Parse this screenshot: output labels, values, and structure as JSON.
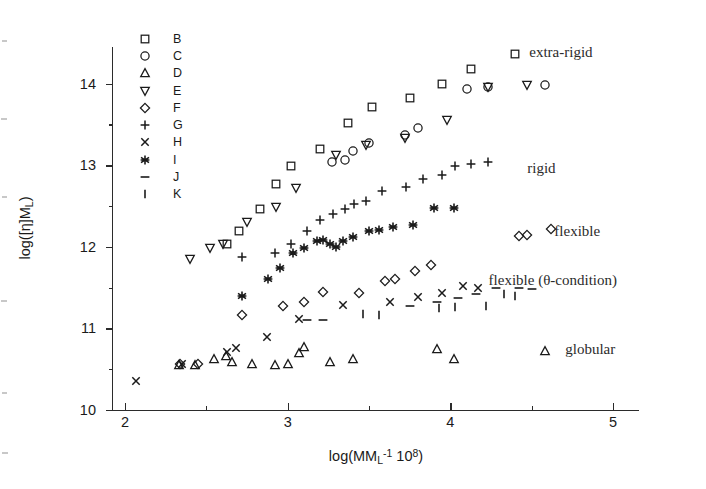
{
  "chart_data": {
    "type": "scatter",
    "title": "",
    "xlabel": "log(MM_L^-1 10^8)",
    "xlabel_parts": {
      "pre": "log(MM",
      "sub": "L",
      "sup": "-1",
      "mid": " 10",
      "sup2": "8",
      "post": ")"
    },
    "ylabel": "log([η]M_L)",
    "ylabel_parts": {
      "pre": "log([η]M",
      "sub": "L",
      "post": ")"
    },
    "xlim": [
      1.92,
      5.25
    ],
    "ylim": [
      10.0,
      14.45
    ],
    "xticks": [
      2,
      3,
      4,
      5
    ],
    "xticks_minor": [
      2.5,
      3.5,
      4.5
    ],
    "yticks": [
      10,
      11,
      12,
      13,
      14
    ],
    "yticks_minor": [
      10.5,
      11.5,
      12.5,
      13.5
    ],
    "grid": false,
    "legend_position": "upper-left-inside",
    "series": [
      {
        "name": "B",
        "marker": "square",
        "points": [
          [
            2.63,
            12.03
          ],
          [
            2.7,
            12.19
          ],
          [
            2.83,
            12.47
          ],
          [
            2.93,
            12.77
          ],
          [
            3.02,
            12.99
          ],
          [
            3.2,
            13.2
          ],
          [
            3.37,
            13.52
          ],
          [
            3.52,
            13.72
          ],
          [
            3.75,
            13.82
          ],
          [
            3.95,
            14.0
          ],
          [
            4.13,
            14.18
          ],
          [
            4.4,
            14.37
          ]
        ]
      },
      {
        "name": "C",
        "marker": "circle",
        "points": [
          [
            3.27,
            13.04
          ],
          [
            3.35,
            13.06
          ],
          [
            3.4,
            13.17
          ],
          [
            3.5,
            13.27
          ],
          [
            3.72,
            13.37
          ],
          [
            3.8,
            13.46
          ],
          [
            4.1,
            13.93
          ],
          [
            4.23,
            13.96
          ],
          [
            4.58,
            13.98
          ]
        ]
      },
      {
        "name": "D",
        "marker": "triangle-up",
        "points": [
          [
            2.33,
            10.55
          ],
          [
            2.43,
            10.55
          ],
          [
            2.55,
            10.63
          ],
          [
            2.62,
            10.66
          ],
          [
            2.66,
            10.59
          ],
          [
            2.78,
            10.57
          ],
          [
            2.92,
            10.55
          ],
          [
            3.0,
            10.56
          ],
          [
            3.07,
            10.7
          ],
          [
            3.1,
            10.77
          ],
          [
            3.26,
            10.59
          ],
          [
            3.4,
            10.62
          ],
          [
            3.92,
            10.75
          ],
          [
            4.02,
            10.63
          ],
          [
            4.58,
            10.72
          ]
        ]
      },
      {
        "name": "E",
        "marker": "triangle-down",
        "points": [
          [
            2.4,
            11.85
          ],
          [
            2.52,
            11.99
          ],
          [
            2.6,
            12.03
          ],
          [
            2.75,
            12.3
          ],
          [
            2.93,
            12.49
          ],
          [
            3.05,
            12.72
          ],
          [
            3.3,
            13.13
          ],
          [
            3.48,
            13.25
          ],
          [
            3.72,
            13.33
          ],
          [
            3.98,
            13.56
          ],
          [
            4.23,
            13.96
          ],
          [
            4.47,
            13.99
          ]
        ]
      },
      {
        "name": "F",
        "marker": "diamond",
        "points": [
          [
            2.34,
            10.56
          ],
          [
            2.45,
            10.57
          ],
          [
            2.72,
            11.16
          ],
          [
            2.97,
            11.28
          ],
          [
            3.1,
            11.33
          ],
          [
            3.22,
            11.45
          ],
          [
            3.44,
            11.44
          ],
          [
            3.6,
            11.58
          ],
          [
            3.66,
            11.6
          ],
          [
            3.78,
            11.7
          ],
          [
            3.88,
            11.78
          ],
          [
            4.42,
            12.13
          ],
          [
            4.47,
            12.14
          ],
          [
            4.62,
            12.22
          ]
        ]
      },
      {
        "name": "G",
        "marker": "plus",
        "points": [
          [
            2.72,
            11.87
          ],
          [
            2.92,
            11.92
          ],
          [
            3.02,
            12.03
          ],
          [
            3.12,
            12.2
          ],
          [
            3.2,
            12.33
          ],
          [
            3.28,
            12.4
          ],
          [
            3.35,
            12.47
          ],
          [
            3.41,
            12.52
          ],
          [
            3.48,
            12.56
          ],
          [
            3.58,
            12.68
          ],
          [
            3.73,
            12.73
          ],
          [
            3.83,
            12.83
          ],
          [
            3.95,
            12.88
          ],
          [
            4.03,
            12.99
          ],
          [
            4.13,
            13.02
          ],
          [
            4.23,
            13.04
          ]
        ]
      },
      {
        "name": "H",
        "marker": "cross",
        "points": [
          [
            2.07,
            10.36
          ],
          [
            2.35,
            10.57
          ],
          [
            2.63,
            10.71
          ],
          [
            2.68,
            10.76
          ],
          [
            2.87,
            10.9
          ],
          [
            3.07,
            11.12
          ],
          [
            3.34,
            11.29
          ],
          [
            3.63,
            11.33
          ],
          [
            3.8,
            11.38
          ],
          [
            3.95,
            11.43
          ],
          [
            4.08,
            11.52
          ],
          [
            4.17,
            11.5
          ]
        ]
      },
      {
        "name": "I",
        "marker": "asterisk",
        "points": [
          [
            2.72,
            11.4
          ],
          [
            2.88,
            11.61
          ],
          [
            2.95,
            11.74
          ],
          [
            3.03,
            11.92
          ],
          [
            3.1,
            11.98
          ],
          [
            3.18,
            12.07
          ],
          [
            3.22,
            12.09
          ],
          [
            3.26,
            12.03
          ],
          [
            3.3,
            12.0
          ],
          [
            3.34,
            12.07
          ],
          [
            3.4,
            12.12
          ],
          [
            3.5,
            12.2
          ],
          [
            3.56,
            12.21
          ],
          [
            3.65,
            12.24
          ],
          [
            3.77,
            12.27
          ],
          [
            3.9,
            12.48
          ],
          [
            4.02,
            12.48
          ]
        ]
      },
      {
        "name": "J",
        "marker": "dash",
        "points": [
          [
            3.12,
            11.1
          ],
          [
            3.22,
            11.1
          ],
          [
            3.75,
            11.28
          ],
          [
            3.92,
            11.32
          ],
          [
            4.05,
            11.37
          ],
          [
            4.16,
            11.42
          ],
          [
            4.28,
            11.49
          ],
          [
            4.42,
            11.5
          ],
          [
            4.5,
            11.48
          ]
        ]
      },
      {
        "name": "K",
        "marker": "bar",
        "points": [
          [
            3.46,
            11.18
          ],
          [
            3.56,
            11.17
          ],
          [
            3.93,
            11.25
          ],
          [
            4.03,
            11.26
          ],
          [
            4.22,
            11.28
          ],
          [
            4.33,
            11.42
          ],
          [
            4.4,
            11.4
          ]
        ]
      }
    ],
    "annotations": [
      {
        "text": "extra-rigid",
        "x": 4.68,
        "y": 14.38
      },
      {
        "text": "rigid",
        "x": 4.56,
        "y": 12.95
      },
      {
        "text": "flexible",
        "x": 4.78,
        "y": 12.18
      },
      {
        "text": "flexible (θ-condition)",
        "x": 4.63,
        "y": 11.58
      },
      {
        "text": "globular",
        "x": 4.86,
        "y": 10.73
      }
    ]
  },
  "legend": {
    "items": [
      {
        "symbol": "square",
        "label": "B"
      },
      {
        "symbol": "circle",
        "label": "C"
      },
      {
        "symbol": "triangle-up",
        "label": "D"
      },
      {
        "symbol": "triangle-down",
        "label": "E"
      },
      {
        "symbol": "diamond",
        "label": "F"
      },
      {
        "symbol": "plus",
        "label": "G"
      },
      {
        "symbol": "cross",
        "label": "H"
      },
      {
        "symbol": "asterisk",
        "label": "I"
      },
      {
        "symbol": "dash",
        "label": "J"
      },
      {
        "symbol": "bar",
        "label": "K"
      }
    ]
  },
  "colors": {
    "ink": "#1a1a1a",
    "axis": "#2b2b2b",
    "annotation": "#2b2b2b"
  }
}
